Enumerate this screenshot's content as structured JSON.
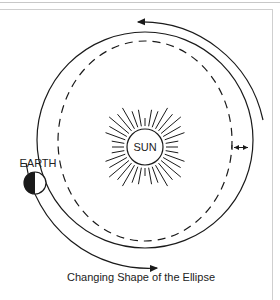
{
  "diagram": {
    "title": "Changing Shape of the Ellipse",
    "labels": {
      "earth": "EARTH",
      "sun": "SUN"
    },
    "elements": {
      "orbit_solid": "near-circular orbit (solid)",
      "orbit_dashed": "elliptical orbit (dashed)",
      "arrow_top": "counterclockwise direction arrow (top)",
      "arrow_bottom": "counterclockwise direction arrow (bottom)",
      "width_arrow": "double-headed arrow showing change in ellipse width"
    },
    "colors": {
      "line": "#1a1a1a",
      "frame": "#cfcfcf"
    }
  }
}
